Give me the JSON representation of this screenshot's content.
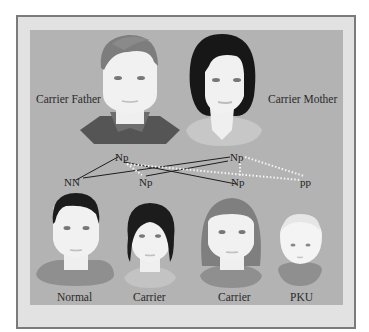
{
  "parents": {
    "father": {
      "label": "Carrier Father",
      "genotype": "Np"
    },
    "mother": {
      "label": "Carrier Mother",
      "genotype": "Np"
    }
  },
  "offspring_genotypes": [
    "NN",
    "Np",
    "Np",
    "pp"
  ],
  "children": [
    {
      "label": "Normal",
      "genotype": "NN"
    },
    {
      "label": "Carrier",
      "genotype": "Np"
    },
    {
      "label": "Carrier",
      "genotype": "Np"
    },
    {
      "label": "PKU",
      "genotype": "pp"
    }
  ],
  "colors": {
    "frame_border": "#7b7b7b",
    "frame_fill": "#e2e2e2",
    "panel": "#b3b3b3",
    "father_line": "#1e1e1e",
    "mother_line": "#f2f2f2"
  }
}
